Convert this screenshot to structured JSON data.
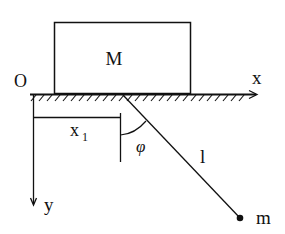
{
  "diagram": {
    "type": "physics-mechanics",
    "colors": {
      "stroke": "#111111",
      "background": "#ffffff"
    },
    "labels": {
      "origin": "O",
      "x_axis": "x",
      "y_axis": "y",
      "block_mass": "M",
      "displacement": "x",
      "displacement_sub": "1",
      "angle": "φ",
      "length": "l",
      "bob_mass": "m"
    },
    "elements": [
      {
        "id": "block",
        "kind": "rectangle",
        "label": "M"
      },
      {
        "id": "ground",
        "kind": "hatched-surface-with-x-axis-arrow"
      },
      {
        "id": "y-axis",
        "kind": "arrow-down"
      },
      {
        "id": "x1-dimension",
        "kind": "dimension-bracket",
        "label": "x1"
      },
      {
        "id": "pendulum-rod",
        "kind": "line",
        "label": "l"
      },
      {
        "id": "angle-arc",
        "kind": "arc",
        "label": "φ"
      },
      {
        "id": "bob",
        "kind": "point-mass",
        "label": "m"
      }
    ]
  }
}
